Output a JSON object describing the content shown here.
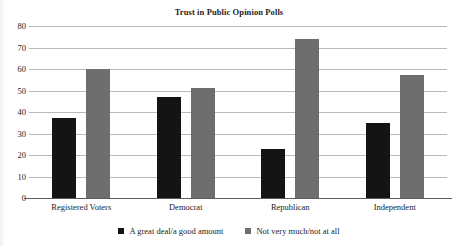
{
  "chart_data": {
    "type": "bar",
    "title": "Trust in Public Opinion Polls",
    "xlabel": "",
    "ylabel": "",
    "ylim": [
      0,
      80
    ],
    "yticks": [
      0,
      10,
      20,
      30,
      40,
      50,
      60,
      70,
      80
    ],
    "grid": true,
    "legend_position": "bottom",
    "categories": [
      "Registered Voters",
      "Democrat",
      "Republican",
      "Independent"
    ],
    "series": [
      {
        "name": "A great deal/a good amount",
        "color": "#141414",
        "values": [
          37,
          47,
          23,
          35
        ]
      },
      {
        "name": "Not very much/not at all",
        "color": "#6e6e6e",
        "values": [
          60,
          51,
          74,
          57
        ]
      }
    ]
  }
}
